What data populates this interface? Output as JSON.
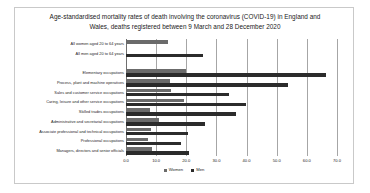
{
  "chart_data": {
    "type": "bar",
    "orientation": "horizontal",
    "title": "Age-standardised mortality rates of death involving the coronavirus (COVID-19) in England and Wales, deaths registered between 9 March and 28 December 2020",
    "title_line1": "Age-standardised mortality rates of death involving the coronavirus (COVID-19) in England and",
    "title_line2": "Wales, deaths registered between 9 March and 28 December 2020",
    "xlabel": "",
    "ylabel": "",
    "xlim": [
      0.0,
      70.0
    ],
    "xticks": [
      "0.0",
      "10.0",
      "20.0",
      "30.0",
      "40.0",
      "50.0",
      "60.0",
      "70.0"
    ],
    "xtick_values": [
      0,
      10,
      20,
      30,
      40,
      50,
      60,
      70
    ],
    "grid": true,
    "legend_position": "bottom",
    "categories": [
      "All women aged 20 to 64 years",
      "All men aged 20 to 64 years",
      "",
      "Elementary occupations",
      "Process, plant and machine operatives",
      "Sales and customer service occupations",
      "Caring, leisure and other service occupations",
      "Skilled trades occupations",
      "Administrative and secretarial occupations",
      "Associate professional and technical occupations",
      "Professional occupations",
      "Managers, directors and senior officials"
    ],
    "series": [
      {
        "name": "Women",
        "color": "#6b6b6b",
        "values": [
          14.0,
          null,
          null,
          20.0,
          14.5,
          15.0,
          19.4,
          8.0,
          11.1,
          8.3,
          7.2,
          8.6
        ]
      },
      {
        "name": "Men",
        "color": "#2b2b2b",
        "values": [
          null,
          25.5,
          null,
          66.3,
          53.8,
          34.3,
          39.7,
          36.4,
          26.2,
          20.6,
          18.3,
          21.0
        ]
      }
    ]
  },
  "legend": {
    "items": [
      {
        "label": "Women",
        "color": "#6b6b6b"
      },
      {
        "label": "Men",
        "color": "#2b2b2b"
      }
    ]
  }
}
